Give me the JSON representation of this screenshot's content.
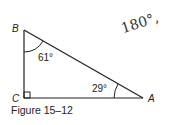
{
  "figure": {
    "caption": "Figure 15–12",
    "vertices": {
      "A": "A",
      "B": "B",
      "C": "C"
    },
    "angles": {
      "B": "61°",
      "A": "29°",
      "C": "right-angle"
    },
    "handwritten_note": "180°,"
  }
}
